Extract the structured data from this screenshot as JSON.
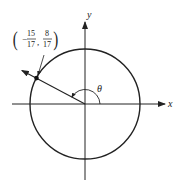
{
  "diagram": {
    "x_axis_label": "x",
    "y_axis_label": "y",
    "angle_label": "θ",
    "point": {
      "x_numerator": "15",
      "x_denominator": "17",
      "x_sign": "−",
      "y_numerator": "8",
      "y_denominator": "17",
      "x_value": -0.8824,
      "y_value": 0.4706
    },
    "colors": {
      "stroke": "#222222",
      "background": "#ffffff"
    }
  }
}
